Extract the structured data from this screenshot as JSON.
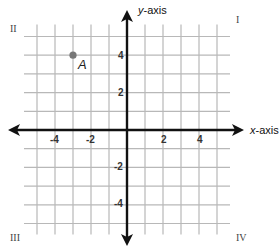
{
  "chart_data": {
    "type": "scatter",
    "title": "",
    "xlabel": "x-axis",
    "ylabel": "y-axis",
    "xlim": [
      -5,
      5
    ],
    "ylim": [
      -5,
      5
    ],
    "grid": true,
    "x_ticks_labeled": [
      -4,
      -2,
      2,
      4
    ],
    "y_ticks_labeled": [
      4,
      2,
      -2,
      -4
    ],
    "points": [
      {
        "label": "A",
        "x": -3,
        "y": 4,
        "color": "#777777"
      }
    ],
    "quadrants": [
      "I",
      "II",
      "III",
      "IV"
    ]
  },
  "axes": {
    "x_label_var": "x",
    "x_label_rest": "-axis",
    "y_label_var": "y",
    "y_label_rest": "-axis"
  },
  "ticks": {
    "x": [
      {
        "value": -4,
        "text": "-4"
      },
      {
        "value": -2,
        "text": "-2"
      },
      {
        "value": 2,
        "text": "2"
      },
      {
        "value": 4,
        "text": "4"
      }
    ],
    "y": [
      {
        "value": 4,
        "text": "4"
      },
      {
        "value": 2,
        "text": "2"
      },
      {
        "value": -2,
        "text": "-2"
      },
      {
        "value": -4,
        "text": "-4"
      }
    ]
  },
  "quadrant_labels": {
    "q1": "I",
    "q2": "II",
    "q3": "III",
    "q4": "IV"
  },
  "point_a": {
    "label": "A"
  },
  "colors": {
    "grid": "#b8b8b8",
    "axis": "#111111",
    "point": "#7a7a7a"
  }
}
